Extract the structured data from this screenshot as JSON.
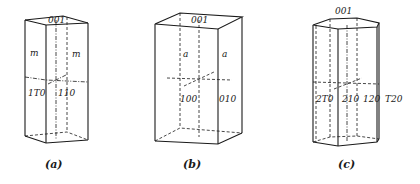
{
  "figures": [
    {
      "id": "a",
      "caption": "(a)",
      "labels": {
        "top": "001",
        "face_left_upper": "m",
        "face_right_upper": "m",
        "face_left_lower": "1̄0",
        "face_right_lower": "1̄10"
      },
      "label_text": {
        "top": "001",
        "face_left_lower": "1T0",
        "face_right_lower": "110"
      }
    },
    {
      "id": "b",
      "caption": "(b)",
      "labels": {
        "top": "001",
        "face_left_upper": "a",
        "face_right_upper": "a",
        "face_left_lower": "100",
        "face_right_lower": "010"
      }
    },
    {
      "id": "c",
      "caption": "(c)",
      "labels": {
        "top": "001",
        "face_1": "2T0",
        "face_2": "210",
        "face_3": "120",
        "face_4": "T20"
      }
    }
  ],
  "colors": {
    "line": "#1a1a1a",
    "background": "#ffffff"
  }
}
